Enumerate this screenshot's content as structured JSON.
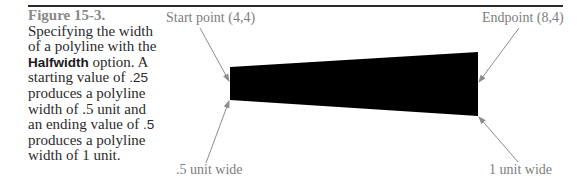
{
  "figure": {
    "title": "Figure 15-3.",
    "caption_lines": [
      {
        "text": "Specifying the width"
      },
      {
        "text": "of a polyline with the"
      },
      {
        "bold": "Halfwidth",
        "text": " option. A"
      },
      {
        "text": "starting value of ",
        "num": ".25"
      },
      {
        "text": "produces a polyline"
      },
      {
        "text": "width of .5 unit and"
      },
      {
        "text": "an ending value of ",
        "num": ".5"
      },
      {
        "text": "produces a polyline"
      },
      {
        "text": "width of 1 unit."
      }
    ]
  },
  "diagram": {
    "labels": {
      "start_point": "Start point (4,4)",
      "endpoint": "Endpoint (8,4)",
      "start_width": ".5 unit wide",
      "end_width": "1 unit wide"
    },
    "polyline": {
      "fill": "#000000",
      "points": "230,67 478,52 478,116 230,100"
    },
    "leader_color": "#8c8c8c"
  }
}
